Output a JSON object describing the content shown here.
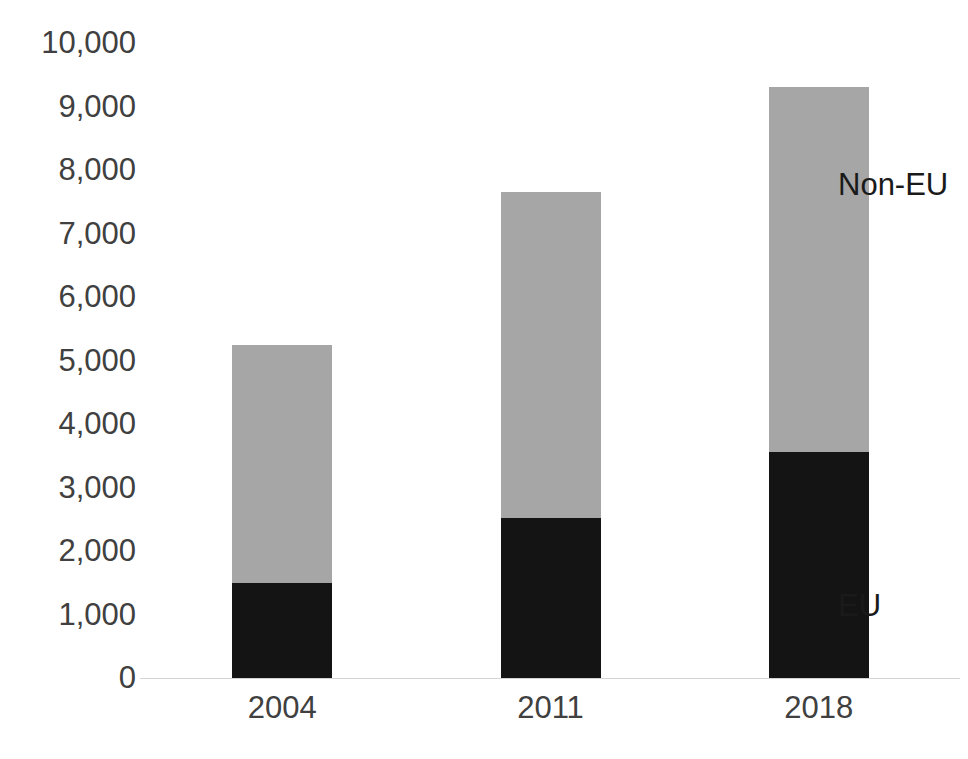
{
  "chart_data": {
    "type": "bar",
    "stacked": true,
    "xlabel": "",
    "ylabel": "",
    "categories": [
      "2004",
      "2011",
      "2018"
    ],
    "series": [
      {
        "name": "EU",
        "color": "#141414",
        "values": [
          1500,
          2520,
          3560
        ]
      },
      {
        "name": "Non-EU",
        "color": "#a6a6a6",
        "values": [
          3750,
          5130,
          5740
        ]
      }
    ],
    "totals": [
      5250,
      7650,
      9300
    ],
    "ylim": [
      0,
      10000
    ],
    "ytick_values": [
      10000,
      9000,
      8000,
      7000,
      6000,
      5000,
      4000,
      3000,
      2000,
      1000,
      0
    ],
    "ytick_labels": [
      "10,000",
      "9,000",
      "8,000",
      "7,000",
      "6,000",
      "5,000",
      "4,000",
      "3,000",
      "2,000",
      "1,000",
      "0"
    ],
    "grid": false,
    "legend_position": "inline-right",
    "annotations": [
      {
        "name": "Non-EU",
        "text": "Non-EU"
      },
      {
        "name": "EU",
        "text": "EU"
      }
    ]
  },
  "axis": {
    "y": {
      "labels": [
        "10,000",
        "9,000",
        "8,000",
        "7,000",
        "6,000",
        "5,000",
        "4,000",
        "3,000",
        "2,000",
        "1,000",
        "0"
      ]
    },
    "x": {
      "labels": [
        "2004",
        "2011",
        "2018"
      ]
    }
  },
  "legend": {
    "noneu_label": "Non-EU",
    "eu_label": "EU"
  },
  "colors": {
    "eu": "#141414",
    "noneu": "#a6a6a6",
    "axis_line": "#d4d4d4",
    "text": "#404040",
    "background": "#ffffff"
  }
}
